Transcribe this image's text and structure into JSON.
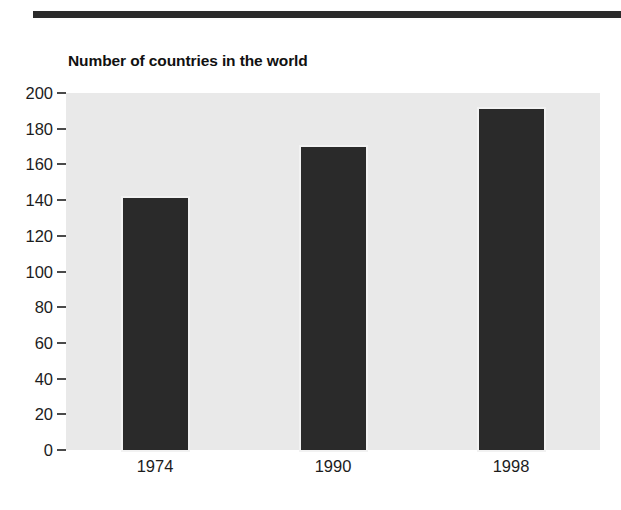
{
  "document": {
    "rule_color": "#2b2b2b"
  },
  "chart_data": {
    "type": "bar",
    "title": "Number of countries in the world",
    "xlabel": "",
    "ylabel": "",
    "categories": [
      "1974",
      "1990",
      "1998"
    ],
    "values": [
      141,
      170,
      191
    ],
    "ylim": [
      0,
      200
    ],
    "yticks": [
      0,
      20,
      40,
      60,
      80,
      100,
      120,
      140,
      160,
      180,
      200
    ],
    "ytick_labels": [
      "0",
      "20",
      "40",
      "60",
      "80",
      "100",
      "120",
      "140",
      "160",
      "180",
      "200"
    ],
    "grid": false,
    "legend": null,
    "bar_color": "#2a2a2a",
    "plot_background": "#e9e9e9"
  }
}
